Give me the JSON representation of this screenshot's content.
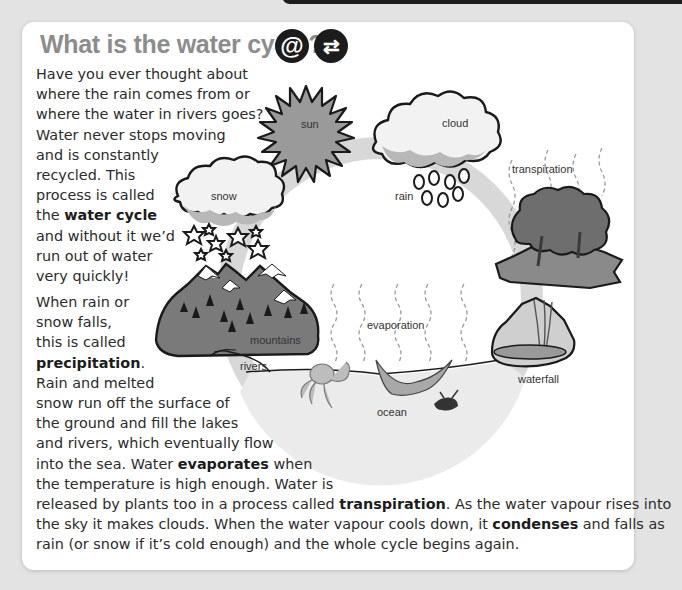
{
  "header": {
    "title": "What is the water cycle?",
    "badges": [
      {
        "icon": "at-icon",
        "glyph": "@"
      },
      {
        "icon": "swap-arrows-icon",
        "glyph": "⇄"
      }
    ]
  },
  "paragraph1": {
    "lines": [
      "Have you ever thought about",
      "where the rain comes from or",
      "where the water in rivers goes?",
      "Water never stops moving",
      "and is constantly",
      "recycled. This",
      "process is called",
      {
        "pre": "the ",
        "bold": "water cycle",
        "post": ""
      },
      "and without it we’d",
      "run out of water",
      "very quickly!"
    ]
  },
  "paragraph2": {
    "lines": [
      "When rain or",
      "snow falls,",
      "this is called",
      {
        "pre": "",
        "bold": "precipitation",
        "post": "."
      },
      "Rain and melted",
      "snow run off the surface of",
      "the ground and fill the lakes",
      "and rivers, which eventually flow",
      {
        "pre": "into the sea. Water ",
        "bold": "evaporates",
        "post": " when"
      },
      "the temperature is high enough. Water is",
      {
        "pre": "released by plants too in a process called ",
        "bold": "transpiration",
        "post": ". As the water vapour rises into"
      },
      {
        "pre": "the sky it makes clouds. When the water vapour cools down, it ",
        "bold": "condenses",
        "post": " and falls as"
      },
      "rain (or snow if it’s cold enough) and the whole cycle begins again."
    ]
  },
  "diagram": {
    "labels": {
      "sun": "sun",
      "cloud": "cloud",
      "rain": "rain",
      "transpiration": "transpiration",
      "snow": "snow",
      "mountains": "mountains",
      "rivers": "rivers",
      "evaporation": "evaporation",
      "ocean": "ocean",
      "waterfall": "waterfall"
    },
    "colors": {
      "ring": "#d6d6d6",
      "ink": "#1a1a1a",
      "sun": "#9a9a9a",
      "land": "#7d7d7d",
      "ocean": "#e8e8e8"
    }
  }
}
